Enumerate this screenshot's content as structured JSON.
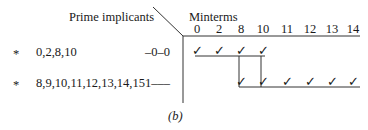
{
  "header": {
    "prime_implicants_label": "Prime implicants",
    "minterms_label": "Minterms"
  },
  "minterm_columns": [
    "0",
    "2",
    "8",
    "10",
    "11",
    "12",
    "13",
    "14"
  ],
  "rows": [
    {
      "marker": "*",
      "minterms": "0,2,8,10",
      "pattern": "–0–0",
      "covered": [
        "0",
        "2",
        "8",
        "10"
      ]
    },
    {
      "marker": "*",
      "minterms": "8,9,10,11,12,13,14,15",
      "pattern": "1–––",
      "covered": [
        "8",
        "10",
        "11",
        "12",
        "13",
        "14"
      ]
    }
  ],
  "check_glyph": "✓",
  "caption": "(b)"
}
